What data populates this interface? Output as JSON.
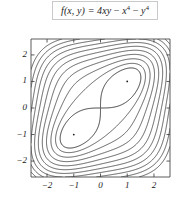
{
  "formula": {
    "label": "f(x, y) = 4xy − x⁴ − y⁴",
    "lhs": "f(x, y) = 4xy",
    "term_x": "x",
    "term_y": "y",
    "exponent": "4",
    "minus": "−"
  },
  "axes": {
    "x_name": "x",
    "y_name": "y",
    "x_ticks": [
      "−2",
      "−1",
      "0",
      "1",
      "2"
    ],
    "y_ticks": [
      "2",
      "1",
      "0",
      "−1",
      "−2"
    ],
    "x_tick_values": [
      -2,
      -1,
      0,
      1,
      2
    ],
    "y_tick_values": [
      2,
      1,
      0,
      -1,
      -2
    ],
    "xlim": [
      -2.6,
      2.6
    ],
    "ylim": [
      -2.6,
      2.6
    ]
  },
  "colors": {
    "line": "#1a1a1a",
    "frame": "#4a4a4a",
    "background": "#ffffff",
    "box_border": "#c9c9c9"
  },
  "chart_data": {
    "type": "contour",
    "function": "4*x*y - x^4 - y^4",
    "xlabel": "x",
    "ylabel": "y",
    "xlim": [
      -2.6,
      2.6
    ],
    "ylim": [
      -2.6,
      2.6
    ],
    "grid": false,
    "legend": "none",
    "levels": [
      0,
      -2,
      -5,
      -9,
      -14,
      -20,
      -27,
      -35,
      -44,
      -54,
      -65
    ],
    "critical_points": [
      {
        "x": 1,
        "y": 1,
        "type": "local maximum",
        "value": 2,
        "marker": "dot"
      },
      {
        "x": -1,
        "y": -1,
        "type": "local maximum",
        "value": 2,
        "marker": "dot"
      },
      {
        "x": 0,
        "y": 0,
        "type": "saddle point",
        "value": 0,
        "marker": "none"
      }
    ],
    "annotations": [
      "figure-eight contour f = 0 passes through the saddle at the origin",
      "nested rounded-square level curves for negative values"
    ]
  }
}
